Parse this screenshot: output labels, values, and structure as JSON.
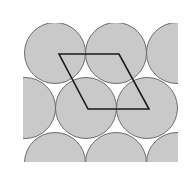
{
  "diagram": {
    "colors": {
      "background": "#ffffff",
      "circle_fill": "#c9c9c9",
      "circle_stroke": "#6e6e6e",
      "cell_stroke": "#1a1a1a"
    },
    "clip_region": {
      "x": 23,
      "y": 23,
      "width": 155,
      "height": 139
    },
    "radius": 30.5,
    "circles": [
      {
        "cx": 55,
        "cy": 53
      },
      {
        "cx": 116,
        "cy": 53
      },
      {
        "cx": 177,
        "cy": 53
      },
      {
        "cx": 25,
        "cy": 108
      },
      {
        "cx": 86,
        "cy": 108
      },
      {
        "cx": 147,
        "cy": 108
      },
      {
        "cx": 55,
        "cy": 163
      },
      {
        "cx": 116,
        "cy": 163
      },
      {
        "cx": 177,
        "cy": 163
      }
    ],
    "unit_cell": {
      "shape": "rhombus",
      "points": [
        [
          59,
          54
        ],
        [
          119,
          54
        ],
        [
          149,
          109
        ],
        [
          88,
          109
        ]
      ]
    }
  }
}
